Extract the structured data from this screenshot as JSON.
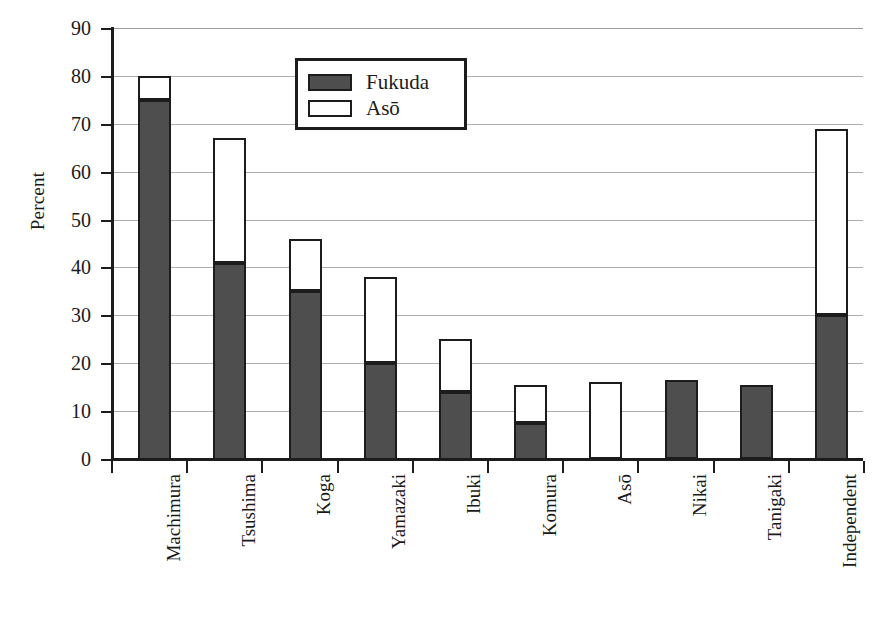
{
  "chart_data": {
    "type": "bar",
    "subtype": "stacked",
    "title": "",
    "xlabel": "",
    "ylabel": "Percent",
    "ylim": [
      0,
      90
    ],
    "ytick_step": 10,
    "yticks": [
      0,
      10,
      20,
      30,
      40,
      50,
      60,
      70,
      80,
      90
    ],
    "ytick_labels": [
      "0",
      "10",
      "20",
      "30",
      "40",
      "50",
      "60",
      "70",
      "80",
      "90"
    ],
    "grid": true,
    "grid_axis": "y",
    "legend_position": "upper-center",
    "categories": [
      "Machimura",
      "Tsushima",
      "Koga",
      "Yamazaki",
      "Ibuki",
      "Komura",
      "Asō",
      "Nikai",
      "Tanigaki",
      "Independent"
    ],
    "series": [
      {
        "name": "Fukuda",
        "color": "#4e4e4e",
        "values": [
          75,
          41,
          35,
          20,
          14,
          7.5,
          0,
          16.5,
          15.5,
          30
        ]
      },
      {
        "name": "Asō",
        "color": "#ffffff",
        "values": [
          5,
          26,
          11,
          18,
          11,
          8,
          16,
          0,
          0,
          39
        ]
      }
    ],
    "totals": [
      80,
      67,
      46,
      38,
      25,
      15.5,
      16,
      16.5,
      15.5,
      69
    ]
  },
  "legend": {
    "items": [
      {
        "label": "Fukuda",
        "swatch": "fukuda"
      },
      {
        "label": "Asō",
        "swatch": "aso"
      }
    ]
  },
  "colors": {
    "fukuda_fill": "#4e4e4e",
    "aso_fill": "#ffffff",
    "outline": "#1c1c1c",
    "gridline": "#aeaeae",
    "background": "#ffffff"
  }
}
